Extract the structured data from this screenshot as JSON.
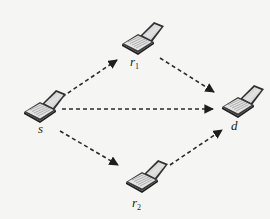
{
  "diagram": {
    "type": "relay-network",
    "nodes": [
      {
        "id": "s",
        "label": "s",
        "subscript": "",
        "role": "source",
        "icon": "laptop-icon",
        "x": 40,
        "y": 104
      },
      {
        "id": "r1",
        "label": "r",
        "subscript": "1",
        "role": "relay",
        "icon": "laptop-icon",
        "x": 138,
        "y": 37
      },
      {
        "id": "d",
        "label": "d",
        "subscript": "",
        "role": "destination",
        "icon": "laptop-icon",
        "x": 238,
        "y": 100
      },
      {
        "id": "r2",
        "label": "r",
        "subscript": "2",
        "role": "relay",
        "icon": "laptop-icon",
        "x": 141,
        "y": 175
      }
    ],
    "edges": [
      {
        "from": "s",
        "to": "r1",
        "style": "dashed",
        "arrow": "end"
      },
      {
        "from": "r1",
        "to": "d",
        "style": "dashed",
        "arrow": "end"
      },
      {
        "from": "s",
        "to": "d",
        "style": "dashed",
        "arrow": "end"
      },
      {
        "from": "s",
        "to": "r2",
        "style": "dashed",
        "arrow": "end"
      },
      {
        "from": "r2",
        "to": "d",
        "style": "dashed",
        "arrow": "end"
      }
    ],
    "colors": {
      "background": "#f5f5f3",
      "line": "#2a2a2a",
      "laptop_body": "#3a3a3a",
      "laptop_screen": "#cfcfcf",
      "keyboard": "#e6e6e6"
    }
  }
}
